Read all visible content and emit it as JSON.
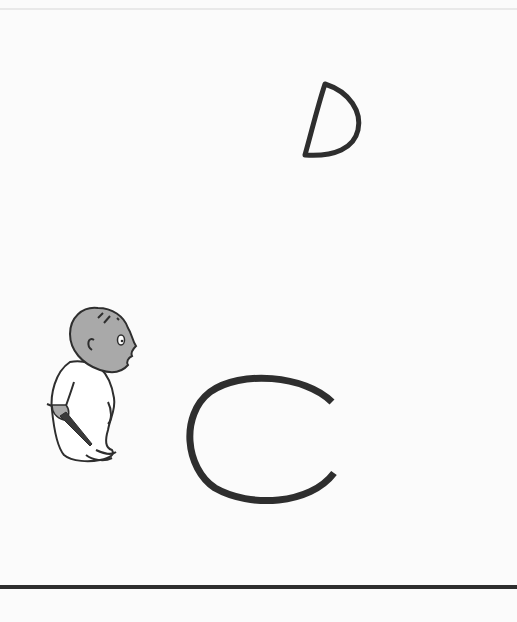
{
  "scene": {
    "type": "illustration",
    "background_color": "#fbfbfb",
    "ink_color": "#2e2e2e",
    "skin_color": "#a9a9a9",
    "elements": [
      {
        "name": "moon",
        "shape": "crescent-moon-drawing"
      },
      {
        "name": "boy",
        "shape": "boy-in-pajamas-holding-crayon"
      },
      {
        "name": "crayon",
        "shape": "crayon"
      },
      {
        "name": "arc",
        "shape": "large-c-shaped-arc"
      },
      {
        "name": "ground",
        "shape": "horizontal-line"
      }
    ]
  }
}
